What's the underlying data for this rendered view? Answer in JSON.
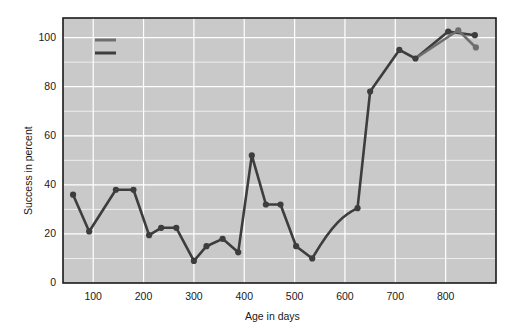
{
  "chart_data": {
    "type": "line",
    "title": "",
    "xlabel": "Age in days",
    "ylabel": "Success in percent",
    "xlim": [
      40,
      900
    ],
    "ylim": [
      0,
      108
    ],
    "xticks": [
      100,
      200,
      300,
      400,
      500,
      600,
      700,
      800
    ],
    "yticks": [
      0,
      20,
      40,
      60,
      80,
      100
    ],
    "grid": true,
    "grid_color": "#ffffff",
    "plot_background": "#c9c9c9",
    "figure_background": "#ffffff",
    "frame_color": "#1a1a1a",
    "legend_position": "upper-left",
    "marker": "circle",
    "series": [
      {
        "name": "Hugh",
        "color": "#6e6e6e",
        "points": [
          {
            "x": 825,
            "y": 103
          },
          {
            "x": 860,
            "y": 96
          }
        ]
      },
      {
        "name": "Hilton",
        "color": "#3d3d3d",
        "points": [
          {
            "x": 60,
            "y": 36
          },
          {
            "x": 92,
            "y": 21
          },
          {
            "x": 145,
            "y": 38
          },
          {
            "x": 180,
            "y": 38
          },
          {
            "x": 211,
            "y": 19.5
          },
          {
            "x": 235,
            "y": 22.5
          },
          {
            "x": 265,
            "y": 22.5
          },
          {
            "x": 300,
            "y": 9
          },
          {
            "x": 325,
            "y": 15
          },
          {
            "x": 357,
            "y": 18
          },
          {
            "x": 388,
            "y": 12.5
          },
          {
            "x": 415,
            "y": 52
          },
          {
            "x": 443,
            "y": 32
          },
          {
            "x": 472,
            "y": 32
          },
          {
            "x": 503,
            "y": 15
          },
          {
            "x": 535,
            "y": 10
          },
          {
            "x": 625,
            "y": 30.5
          },
          {
            "x": 650,
            "y": 78
          },
          {
            "x": 708,
            "y": 95
          },
          {
            "x": 740,
            "y": 91.5
          },
          {
            "x": 805,
            "y": 102.5
          },
          {
            "x": 858,
            "y": 101
          }
        ],
        "curve_segment": {
          "from_index": 15,
          "to_index": 16,
          "note": "smooth curved rise between 535 and 625"
        }
      }
    ],
    "legend": [
      {
        "label": "Hugh",
        "color": "#6e6e6e"
      },
      {
        "label": "Hilton",
        "color": "#3d3d3d"
      }
    ]
  }
}
